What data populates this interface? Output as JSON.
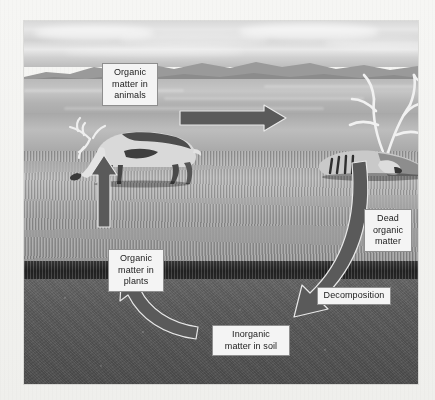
{
  "diagram": {
    "type": "cycle-diagram",
    "color_mode": "grayscale",
    "label_box_fill": "#f4f4f2",
    "label_box_border": "#8e8e8c",
    "arrow_fill": "#5a5a57",
    "arrow_outline": "#e8e8e6"
  },
  "labels": {
    "organic_matter_animals": "Organic\nmatter in\nanimals",
    "organic_matter_plants": "Organic\nmatter in\nplants",
    "dead_organic_matter": "Dead\norganic\nmatter",
    "decomposition": "Decomposition",
    "inorganic_matter_soil": "Inorganic\nmatter in soil"
  },
  "photo": {
    "scene_layers": [
      "sky",
      "mountains",
      "plain",
      "grass",
      "thatch",
      "soil"
    ],
    "subjects": [
      "grazing-caribou",
      "dead-caribou-carcass"
    ]
  },
  "arrows": [
    {
      "name": "animals-to-dead",
      "from": "organic_matter_animals",
      "to": "dead_organic_matter",
      "direction": "right",
      "shape": "straight"
    },
    {
      "name": "dead-to-soil",
      "from": "dead_organic_matter",
      "to": "inorganic_matter_soil",
      "direction": "down-left",
      "shape": "curved",
      "annotation": "decomposition"
    },
    {
      "name": "soil-to-plants",
      "from": "inorganic_matter_soil",
      "to": "organic_matter_plants",
      "direction": "up-left",
      "shape": "curved"
    },
    {
      "name": "plants-to-animals",
      "from": "organic_matter_plants",
      "to": "organic_matter_animals",
      "direction": "up",
      "shape": "straight"
    }
  ]
}
